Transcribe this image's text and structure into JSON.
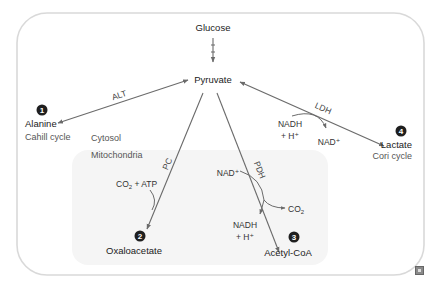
{
  "diagram": {
    "regions": {
      "cytosol_label": "Cytosol",
      "mitochondria_label": "Mitochondria"
    },
    "metabolites": {
      "glucose": "Glucose",
      "pyruvate": "Pyruvate",
      "alanine": "Alanine",
      "lactate": "Lactate",
      "oxaloacetate": "Oxaloacetate",
      "acetyl_coa": "Acetyl-CoA"
    },
    "cycles": {
      "alanine": "Cahill cycle",
      "lactate": "Cori cycle"
    },
    "markers": {
      "alanine": "1",
      "oxaloacetate": "2",
      "acetyl_coa": "3",
      "lactate": "4"
    },
    "enzymes": {
      "alt": "ALT",
      "ldh": "LDH",
      "pc": "PC",
      "pdh": "PDH"
    },
    "cofactors": {
      "ldh_in_line1": "NADH",
      "ldh_in_line2": "+ H⁺",
      "ldh_out": "NAD⁺",
      "pc_in_main": "CO",
      "pc_in_sub": "2",
      "pc_in_rest": " + ATP",
      "pdh_in": "NAD⁺",
      "pdh_out_co2_main": "CO",
      "pdh_out_co2_sub": "2",
      "pdh_out_line1": "NADH",
      "pdh_out_line2": "+ H⁺"
    },
    "colors": {
      "outer_border": "#d9d9d9",
      "mito_fill": "#f5f5f5",
      "arrow": "#6b6b6b",
      "marker_fill": "#1f1f1f"
    }
  }
}
